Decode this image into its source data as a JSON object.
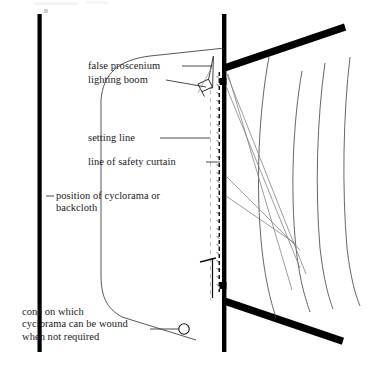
{
  "diagram": {
    "type": "architectural-plan",
    "colors": {
      "ink": "#000000",
      "text": "#1a1a1a",
      "thin_line": "#3a3a3a",
      "faint_line": "#b9b9b9",
      "background": "#ffffff"
    },
    "labels": {
      "false_proscenium": "false proscenium",
      "lighting_boom": "lighting boom",
      "setting_line": "setting line",
      "line_of_safety_curtain": "line of safety curtain",
      "position_of_cyclorama": "position of cyclorama or\nbackcloth",
      "cone_on_which": "cone on which\ncyclorama can be wound\nwhen not required"
    },
    "features": [
      {
        "name": "left-side-wall",
        "style": "thick-black-vertical"
      },
      {
        "name": "cyclorama-curve",
        "style": "thin-rounded-outline"
      },
      {
        "name": "proscenium-wall",
        "style": "thick-black-vertical"
      },
      {
        "name": "upper-auditorium-wall-beam",
        "style": "thick-black-angled"
      },
      {
        "name": "lower-auditorium-wall-beam",
        "style": "thick-black-angled"
      },
      {
        "name": "setting-line",
        "style": "light-grey-dashed-vertical"
      },
      {
        "name": "safety-curtain-line",
        "style": "dark-dashed-vertical"
      },
      {
        "name": "false-proscenium-flat",
        "style": "thin-angled-flat"
      },
      {
        "name": "lighting-lantern",
        "style": "small-tilted-rectangle"
      },
      {
        "name": "seating-row-curves",
        "count": 4,
        "style": "thin-curved"
      },
      {
        "name": "sightlines",
        "count": 4,
        "style": "thin-straight"
      },
      {
        "name": "cyclorama-winding-cone",
        "style": "small-open-circle"
      }
    ]
  }
}
